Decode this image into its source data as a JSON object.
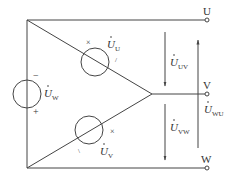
{
  "diagram": {
    "type": "three-phase delta-connected voltage sources",
    "terminals": [
      {
        "id": "U",
        "label": "U"
      },
      {
        "id": "V",
        "label": "V"
      },
      {
        "id": "W",
        "label": "W"
      }
    ],
    "sources": [
      {
        "id": "U",
        "label_main": "U",
        "label_sub": "U",
        "marks": [
          "×",
          "/"
        ]
      },
      {
        "id": "V",
        "label_main": "U",
        "label_sub": "V",
        "marks": [
          "×",
          "\\"
        ]
      },
      {
        "id": "W",
        "label_main": "U",
        "label_sub": "W",
        "polarity_top": "−",
        "polarity_bottom": "+"
      }
    ],
    "line_voltages": [
      {
        "id": "UV",
        "label_main": "U",
        "label_sub": "UV",
        "direction": "down"
      },
      {
        "id": "VW",
        "label_main": "U",
        "label_sub": "VW",
        "direction": "down"
      },
      {
        "id": "WU",
        "label_main": "U",
        "label_sub": "WU",
        "direction": "up"
      }
    ],
    "colors": {
      "line": "#444444",
      "text": "#333333",
      "background": "#ffffff"
    }
  }
}
